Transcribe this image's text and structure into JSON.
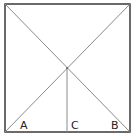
{
  "diagram": {
    "shape": "square",
    "square": {
      "x": 5,
      "y": 4,
      "width": 125,
      "height": 128
    },
    "intersection": {
      "x": 67,
      "y": 68
    },
    "labels": {
      "A": "A",
      "B": "B",
      "C": "C"
    },
    "colors": {
      "border": "#3a3a3a",
      "lines": "#8a8a8a",
      "text": "#222222"
    }
  }
}
